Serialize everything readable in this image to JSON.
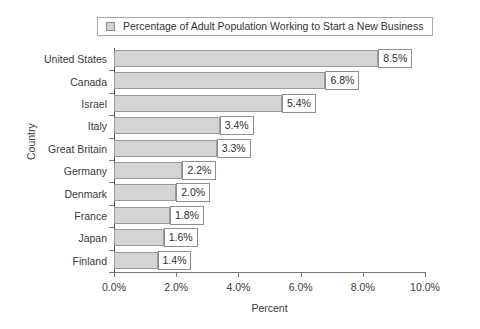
{
  "legend": {
    "swatch_icon": "legend-swatch-icon",
    "label": "Percentage of Adult Population Working to Start a New Business",
    "swatch_color": "#d2d2d2"
  },
  "chart_data": {
    "type": "bar",
    "orientation": "horizontal",
    "title": "",
    "subtitle": "",
    "xlabel": "Percent",
    "ylabel": "Country",
    "categories": [
      "United States",
      "Canada",
      "Israel",
      "Italy",
      "Great Britain",
      "Germany",
      "Denmark",
      "France",
      "Japan",
      "Finland"
    ],
    "values": [
      8.5,
      6.8,
      5.4,
      3.4,
      3.3,
      2.2,
      2.0,
      1.8,
      1.6,
      1.4
    ],
    "data_labels": [
      "8.5%",
      "6.8%",
      "5.4%",
      "3.4%",
      "3.3%",
      "2.2%",
      "2.0%",
      "1.8%",
      "1.6%",
      "1.4%"
    ],
    "series": [
      {
        "name": "Percentage of Adult Population Working to Start a New Business",
        "values": [
          8.5,
          6.8,
          5.4,
          3.4,
          3.3,
          2.2,
          2.0,
          1.8,
          1.6,
          1.4
        ],
        "color": "#d4d4d4"
      }
    ],
    "xlim": [
      0,
      10
    ],
    "xticks": [
      0,
      2,
      4,
      6,
      8,
      10
    ],
    "xtick_labels": [
      "0.0%",
      "2.0%",
      "4.0%",
      "6.0%",
      "8.0%",
      "10.0%"
    ],
    "grid": false,
    "legend_position": "top-center",
    "bar_color": "#d4d4d4",
    "bar_border_color": "#9a9a9a"
  }
}
